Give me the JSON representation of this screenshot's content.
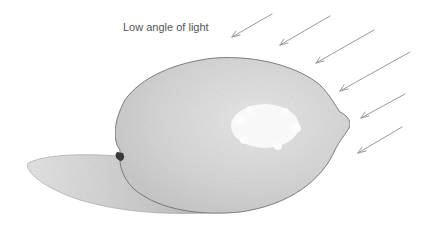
{
  "diagram": {
    "caption": "Low angle of light",
    "elements": [
      "lemon",
      "cast-shadow",
      "highlight",
      "light-arrows"
    ],
    "arrow_count": 6,
    "arrow_direction": "down-left"
  },
  "colors": {
    "background": "#ffffff",
    "lemon_fill": "#d4d4d4",
    "lemon_outline": "#6a6a6a",
    "shadow_fill": "#c8c8c8",
    "highlight": "#fbfbfb",
    "arrow": "#9a9a9a",
    "caption_text": "#555555"
  }
}
